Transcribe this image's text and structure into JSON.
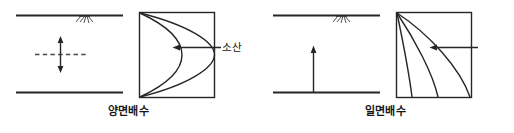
{
  "figure": {
    "type": "engineering-diagram",
    "background_color": "#ffffff",
    "line_color": "#262626",
    "panels": [
      {
        "id": "double-drainage",
        "caption": "양면배수",
        "annotation_label": "소산",
        "soil_layer": {
          "top_boundary": "drainage-surface-line",
          "bottom_boundary": "drainage-surface-line",
          "hatch_symbol": "ground-surface-hatch",
          "arrow": "double-headed-vertical-arrow",
          "centerline": "dashed-horizontal-centerline"
        },
        "isochrone_box": {
          "curve_count": 2,
          "curve_shape": "parabolic-opening-left",
          "anchor_corners": [
            "top-left",
            "bottom-left"
          ]
        }
      },
      {
        "id": "single-drainage",
        "caption": "일면배수",
        "annotation_label": "소산",
        "soil_layer": {
          "top_boundary": "drainage-surface-line",
          "bottom_boundary": "impermeable-base-line",
          "hatch_symbol": "ground-surface-hatch",
          "arrow": "single-headed-upward-arrow"
        },
        "isochrone_box": {
          "curve_count": 3,
          "curve_shape": "concave-fan-from-top-left",
          "anchor_corners": [
            "top-left"
          ]
        }
      }
    ]
  }
}
